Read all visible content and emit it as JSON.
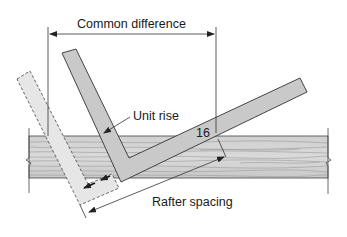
{
  "diagram": {
    "type": "framing-square-rafter-layout",
    "labels": {
      "common_difference": "Common difference",
      "unit_rise": "Unit rise",
      "sixteen": "16",
      "rafter_spacing": "Rafter spacing"
    },
    "colors": {
      "square_solid_fill": "#c9c9c9",
      "square_dashed_fill": "#e4e4e4",
      "board_fill": "#d6d6d6",
      "grain": "#9a9a9a",
      "line": "#333333",
      "background": "#ffffff"
    },
    "elements": {
      "board": "Wood board / top plate with grain, broken ends",
      "square_solid": "Framing square in current position",
      "square_dashed": "Framing square in previous position (dashed outline)",
      "arrows": "Two arrows indicating sliding the square along the board"
    }
  }
}
